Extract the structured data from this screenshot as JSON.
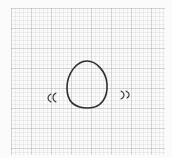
{
  "sketch": {
    "subject": "wobbling egg",
    "paper": "graph paper",
    "stroke_color": "#2e2e2e",
    "grid_color": "#d6d6d6",
    "elements": [
      {
        "name": "egg",
        "shape": "egg outline",
        "bbox": [
          66,
          60,
          108,
          109
        ]
      },
      {
        "name": "motion-marks-left",
        "glyph": "((",
        "bbox": [
          47,
          94,
          57,
          102
        ]
      },
      {
        "name": "motion-marks-right",
        "glyph": "))",
        "bbox": [
          120,
          91,
          130,
          99
        ]
      }
    ]
  }
}
